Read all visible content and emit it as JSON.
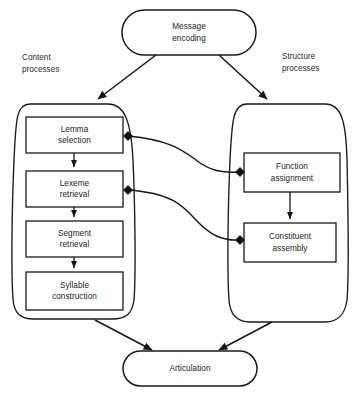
{
  "diagram": {
    "background_color": "#ffffff",
    "stroke_color": "#1a1a1a",
    "text_color": "#1b1b1b",
    "nodes": {
      "message_encoding": {
        "label": "Message\nencoding",
        "shape": "stadium"
      },
      "articulation": {
        "label": "Articulation",
        "shape": "stadium"
      },
      "lemma_selection": {
        "label": "Lemma\nselection",
        "shape": "rect"
      },
      "lexeme_retrieval": {
        "label": "Lexeme\nretrieval",
        "shape": "rect"
      },
      "segment_retrieval": {
        "label": "Segment\nretrieval",
        "shape": "rect"
      },
      "syllable_construction": {
        "label": "Syllable\nconstruction",
        "shape": "rect"
      },
      "function_assignment": {
        "label": "Function\nassignment",
        "shape": "rect"
      },
      "constituent_assembly": {
        "label": "Constituent\nassembly",
        "shape": "rect"
      }
    },
    "group_labels": {
      "content": "Content\nprocesses",
      "structure": "Structure\nprocesses"
    },
    "containers": {
      "content_container": "Content processes container",
      "structure_container": "Structure processes container"
    },
    "edges": [
      {
        "name": "message-to-content",
        "from": "message_encoding",
        "to": "content_container",
        "style": "arrow"
      },
      {
        "name": "message-to-structure",
        "from": "message_encoding",
        "to": "structure_container",
        "style": "arrow"
      },
      {
        "name": "lemma-to-lexeme",
        "from": "lemma_selection",
        "to": "lexeme_retrieval",
        "style": "arrow"
      },
      {
        "name": "lexeme-to-segment",
        "from": "lexeme_retrieval",
        "to": "segment_retrieval",
        "style": "arrow"
      },
      {
        "name": "segment-to-syllable",
        "from": "segment_retrieval",
        "to": "syllable_construction",
        "style": "arrow"
      },
      {
        "name": "function-to-constituent",
        "from": "function_assignment",
        "to": "constituent_assembly",
        "style": "arrow"
      },
      {
        "name": "lemma-to-function",
        "from": "lemma_selection",
        "to": "function_assignment",
        "style": "curve-diamond"
      },
      {
        "name": "lexeme-to-constituent",
        "from": "lexeme_retrieval",
        "to": "constituent_assembly",
        "style": "curve-diamond"
      },
      {
        "name": "content-to-articulation",
        "from": "content_container",
        "to": "articulation",
        "style": "arrow"
      },
      {
        "name": "structure-to-articulation",
        "from": "structure_container",
        "to": "articulation",
        "style": "arrow"
      }
    ]
  }
}
